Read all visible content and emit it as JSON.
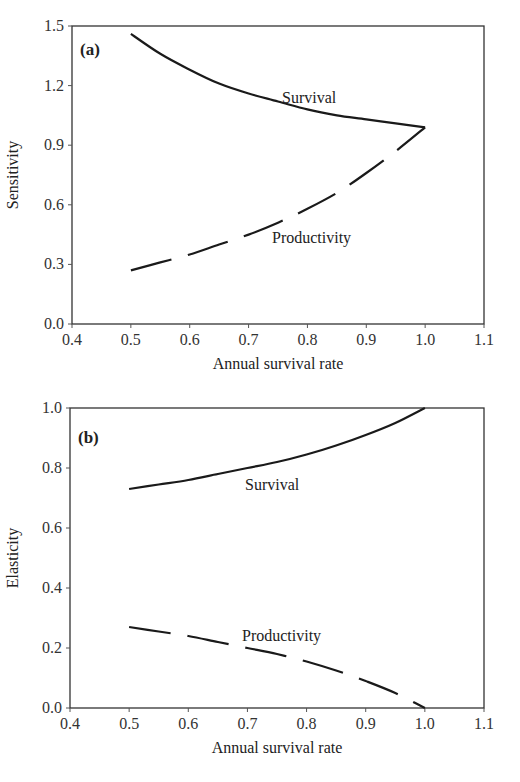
{
  "chart_data": [
    {
      "type": "line",
      "panel": "(a)",
      "title": "",
      "xlabel": "Annual survival rate",
      "ylabel": "Sensitivity",
      "xlim": [
        0.4,
        1.1
      ],
      "ylim": [
        0.0,
        1.5
      ],
      "xticks": [
        "0.4",
        "0.5",
        "0.6",
        "0.7",
        "0.8",
        "0.9",
        "1.0",
        "1.1"
      ],
      "yticks": [
        "0.0",
        "0.3",
        "0.6",
        "0.9",
        "1.2",
        "1.5"
      ],
      "grid": false,
      "legend": "inline labels",
      "x": [
        0.5,
        0.55,
        0.6,
        0.65,
        0.7,
        0.75,
        0.8,
        0.85,
        0.9,
        0.95,
        1.0
      ],
      "series": [
        {
          "name": "Survival",
          "style": "solid",
          "label_pos": [
            0.78,
            1.15
          ],
          "values": [
            1.46,
            1.36,
            1.28,
            1.21,
            1.16,
            1.12,
            1.08,
            1.05,
            1.03,
            1.01,
            0.99
          ]
        },
        {
          "name": "Productivity",
          "style": "dashed",
          "label_pos": [
            0.7,
            0.28
          ],
          "values": [
            0.27,
            0.31,
            0.35,
            0.4,
            0.45,
            0.51,
            0.58,
            0.66,
            0.76,
            0.87,
            0.99
          ]
        }
      ]
    },
    {
      "type": "line",
      "panel": "(b)",
      "title": "",
      "xlabel": "Annual survival rate",
      "ylabel": "Elasticity",
      "xlim": [
        0.4,
        1.1
      ],
      "ylim": [
        0.0,
        1.0
      ],
      "xticks": [
        "0.4",
        "0.5",
        "0.6",
        "0.7",
        "0.8",
        "0.9",
        "1.0",
        "1.1"
      ],
      "yticks": [
        "0.0",
        "0.2",
        "0.4",
        "0.6",
        "0.8",
        "1.0"
      ],
      "grid": false,
      "legend": "inline labels",
      "x": [
        0.5,
        0.55,
        0.6,
        0.65,
        0.7,
        0.75,
        0.8,
        0.85,
        0.9,
        0.95,
        1.0
      ],
      "series": [
        {
          "name": "Survival",
          "style": "solid",
          "label_pos": [
            0.67,
            0.69
          ],
          "values": [
            0.73,
            0.745,
            0.76,
            0.78,
            0.8,
            0.82,
            0.845,
            0.875,
            0.91,
            0.95,
            1.0
          ]
        },
        {
          "name": "Productivity",
          "style": "dashed",
          "label_pos": [
            0.67,
            0.25
          ],
          "values": [
            0.27,
            0.255,
            0.24,
            0.22,
            0.2,
            0.18,
            0.155,
            0.125,
            0.09,
            0.05,
            0.0
          ]
        }
      ]
    }
  ],
  "panels": {
    "a": {
      "label": "(a)",
      "xlabel": "Annual survival rate",
      "ylabel": "Sensitivity",
      "survival_label": "Survival",
      "productivity_label": "Productivity"
    },
    "b": {
      "label": "(b)",
      "xlabel": "Annual survival rate",
      "ylabel": "Elasticity",
      "survival_label": "Survival",
      "productivity_label": "Productivity"
    }
  },
  "colors": {
    "line": "#1a1a1a",
    "axis": "#333333",
    "background": "#ffffff"
  }
}
